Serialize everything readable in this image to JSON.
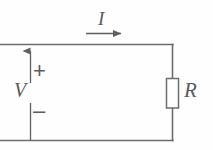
{
  "diagram": {
    "type": "circuit-schematic",
    "background_color": "#fefefe",
    "line_color": "#6b6b6b",
    "text_color": "#5a5a5a"
  },
  "labels": {
    "current": "I",
    "voltage": "V",
    "resistance": "R",
    "polarity_positive": "+",
    "polarity_negative": "–"
  },
  "elements": {
    "current_arrow": {
      "name": "current-direction-arrow",
      "direction": "right",
      "label": "I"
    },
    "voltage_arrow": {
      "name": "voltage-polarity-arrow",
      "direction": "up",
      "label": "V"
    },
    "resistor": {
      "name": "resistor-symbol",
      "label": "R",
      "orientation": "vertical"
    },
    "wires": {
      "top": "top-wire",
      "right": "right-wire",
      "bottom": "bottom-wire"
    }
  }
}
